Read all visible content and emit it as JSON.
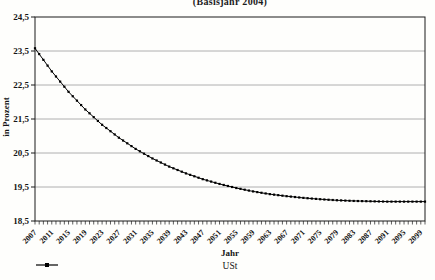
{
  "figure": {
    "title": "(Basisjahr 2004)",
    "background_color": "#fefefc",
    "line_color": "#1a1a1a",
    "grid_color": "#9c9c9c"
  },
  "chart_data": {
    "type": "line",
    "title": "(Basisjahr 2004)",
    "xlabel": "Jahr",
    "ylabel": "in Prozent",
    "ylim": [
      18.5,
      24.5
    ],
    "y_tick_values": [
      24.5,
      23.5,
      22.5,
      21.5,
      20.5,
      19.5,
      18.5
    ],
    "y_tick_labels": [
      "24,5",
      "23,5",
      "22,5",
      "21,5",
      "20,5",
      "19,5",
      "18,5"
    ],
    "x_range": [
      2007,
      2100
    ],
    "x_minor_tick_step_years": 1,
    "x_tick_label_years": [
      2007,
      2011,
      2015,
      2019,
      2023,
      2027,
      2031,
      2035,
      2039,
      2043,
      2047,
      2051,
      2055,
      2059,
      2063,
      2067,
      2071,
      2075,
      2079,
      2083,
      2087,
      2091,
      2095,
      2099
    ],
    "grid": "horizontal-only",
    "legend": {
      "position": "bottom-center",
      "entries": [
        {
          "label": "USt",
          "color": "#000000",
          "marker": "square-on-line"
        }
      ]
    },
    "series": [
      {
        "name": "USt",
        "color": "#000000",
        "marker": "square",
        "marker_every_years": 1,
        "x": [
          2007,
          2011,
          2015,
          2019,
          2023,
          2027,
          2031,
          2035,
          2039,
          2043,
          2047,
          2051,
          2055,
          2059,
          2063,
          2067,
          2071,
          2075,
          2079,
          2083,
          2087,
          2091,
          2095,
          2099,
          2100
        ],
        "values": [
          23.58,
          22.9,
          22.3,
          21.78,
          21.33,
          20.95,
          20.62,
          20.34,
          20.1,
          19.9,
          19.73,
          19.59,
          19.47,
          19.37,
          19.29,
          19.23,
          19.18,
          19.14,
          19.11,
          19.09,
          19.08,
          19.07,
          19.07,
          19.07,
          19.07
        ]
      }
    ]
  }
}
